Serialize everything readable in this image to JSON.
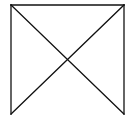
{
  "diagram": {
    "stroke_color": "#111111",
    "background": "#ffffff",
    "lines": [
      {
        "name": "top-edge",
        "x1": 11,
        "y1": 5,
        "x2": 124,
        "y2": 5
      },
      {
        "name": "left-edge",
        "x1": 11,
        "y1": 5,
        "x2": 11,
        "y2": 114
      },
      {
        "name": "right-edge",
        "x1": 124,
        "y1": 5,
        "x2": 124,
        "y2": 114
      },
      {
        "name": "diagonal-top-left-to-bottom-right",
        "x1": 11,
        "y1": 5,
        "x2": 124,
        "y2": 114
      },
      {
        "name": "diagonal-top-right-to-bottom-left",
        "x1": 124,
        "y1": 5,
        "x2": 11,
        "y2": 114
      }
    ],
    "intersection": {
      "x": 68,
      "y": 61
    }
  }
}
